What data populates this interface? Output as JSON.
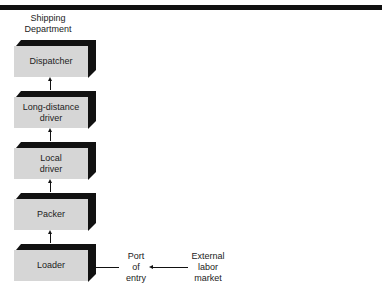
{
  "header": {
    "department": "Shipping\nDepartment"
  },
  "boxes": [
    {
      "label": "Dispatcher"
    },
    {
      "label": "Long-distance\ndriver"
    },
    {
      "label": "Local\ndriver"
    },
    {
      "label": "Packer"
    },
    {
      "label": "Loader"
    }
  ],
  "entry": {
    "port": "Port\nof\nentry",
    "market": "External\nlabor\nmarket"
  },
  "colors": {
    "box_face": "#d6d6d6",
    "box_shadow": "#111111",
    "top_bar": "#111111"
  }
}
